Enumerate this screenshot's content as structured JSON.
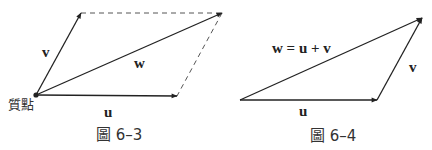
{
  "figure_6_3": {
    "caption": "圖 6–3",
    "labels": {
      "u": "u",
      "v": "v",
      "w": "w",
      "origin": "質點"
    },
    "vectors": [
      {
        "name": "u",
        "from": [
          36,
          95
        ],
        "to": [
          177,
          96
        ],
        "style": "solid-arrow"
      },
      {
        "name": "v",
        "from": [
          36,
          95
        ],
        "to": [
          81,
          13
        ],
        "style": "solid-arrow"
      },
      {
        "name": "w",
        "from": [
          36,
          95
        ],
        "to": [
          222,
          13
        ],
        "style": "solid-arrow"
      }
    ],
    "dashed": [
      {
        "from": [
          81,
          13
        ],
        "to": [
          222,
          13
        ]
      },
      {
        "from": [
          222,
          13
        ],
        "to": [
          177,
          96
        ]
      }
    ]
  },
  "figure_6_4": {
    "caption": "圖 6–4",
    "labels": {
      "u": "u",
      "v": "v",
      "w_eq": "w = u + v"
    },
    "vectors": [
      {
        "name": "u",
        "from": [
          240,
          100
        ],
        "to": [
          377,
          100
        ],
        "style": "solid-arrow"
      },
      {
        "name": "v",
        "from": [
          377,
          100
        ],
        "to": [
          422,
          18
        ],
        "style": "solid-arrow"
      },
      {
        "name": "w",
        "from": [
          240,
          100
        ],
        "to": [
          422,
          18
        ],
        "style": "solid-arrow"
      }
    ]
  }
}
